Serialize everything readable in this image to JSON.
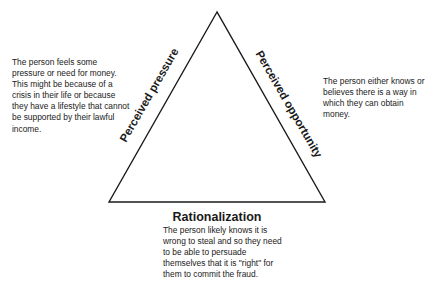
{
  "diagram": {
    "type": "fraud-triangle",
    "triangle": {
      "apex": [
        217,
        12
      ],
      "bottom_left": [
        109,
        202
      ],
      "bottom_right": [
        325,
        202
      ],
      "stroke_color": "#1a1a1a"
    },
    "sides": {
      "left": {
        "label": "Perceived pressure",
        "description": "The person feels some pressure or need for money. This might be because of a crisis in their life or because they have a lifestyle that cannot be supported by their lawful income."
      },
      "right": {
        "label": "Perceived opportunity",
        "description": "The person either knows or believes there is a way in which they can obtain money."
      },
      "bottom": {
        "label": "Rationalization",
        "description": "The person likely knows it is wrong to steal and so they need to be able to persuade themselves that it is \"right\" for them to commit the fraud."
      }
    }
  }
}
